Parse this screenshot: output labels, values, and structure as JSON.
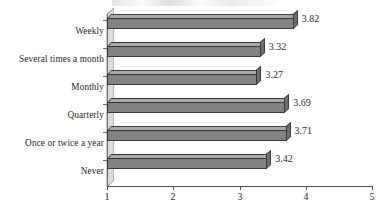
{
  "chart_data": {
    "type": "bar",
    "orientation": "horizontal",
    "title": "",
    "xlabel": "",
    "ylabel": "",
    "xlim": [
      1,
      5
    ],
    "xticks": [
      "1",
      "2",
      "3",
      "4",
      "5"
    ],
    "grid": false,
    "legend": false,
    "categories": [
      "Weekly",
      "Several times a month",
      "Monthly",
      "Quarterly",
      "Once or twice a year",
      "Never"
    ],
    "values": [
      3.82,
      3.32,
      3.27,
      3.69,
      3.71,
      3.42
    ],
    "value_labels": [
      "3.82",
      "3.32",
      "3.27",
      "3.69",
      "3.71",
      "3.42"
    ],
    "colors": {
      "bar_front": "#828282",
      "bar_top": "#a9a9a9",
      "bar_side": "#6e6e6e",
      "bar_outline": "#3a3a3a",
      "axis": "#4d4d4d",
      "wall": "#dcdcdc",
      "background": "#ffffff",
      "text": "#1f1f1f"
    }
  }
}
